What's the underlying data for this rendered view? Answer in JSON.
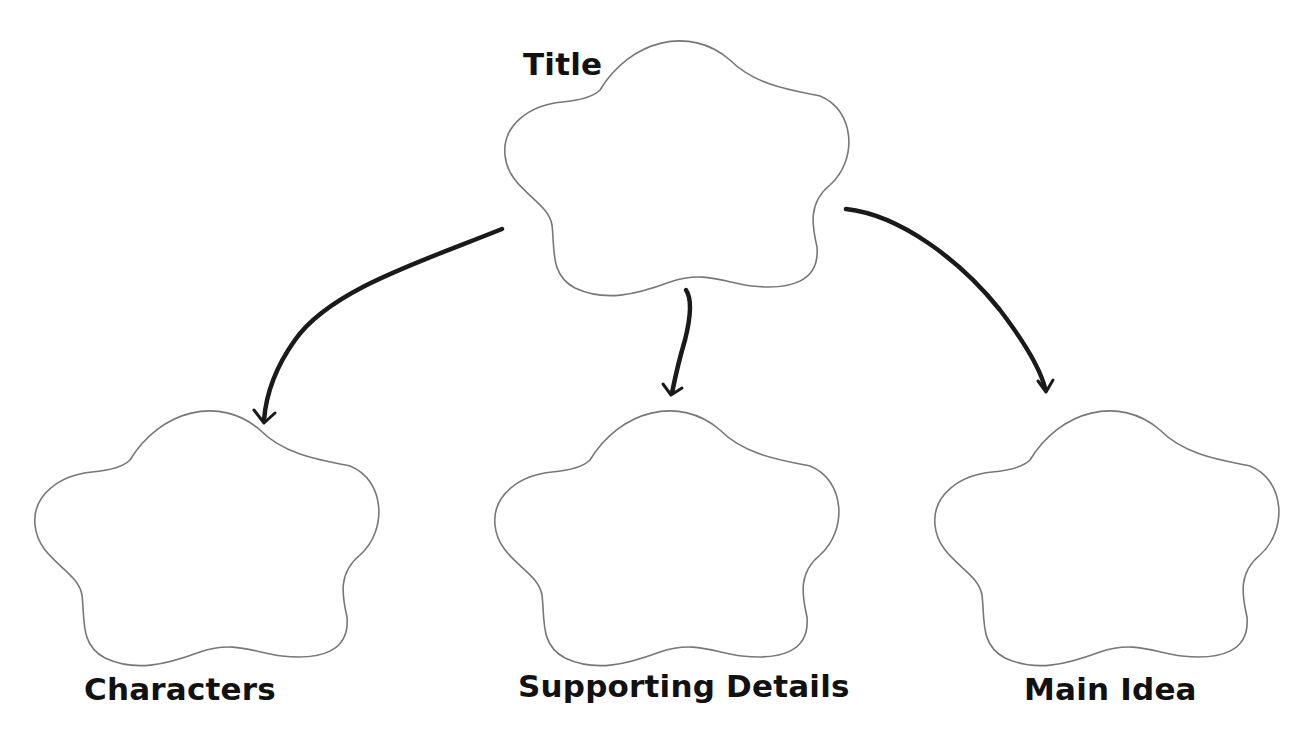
{
  "diagram": {
    "type": "graphic-organizer",
    "colors": {
      "outline": "#777777",
      "arrow": "#1a1a1a",
      "text": "#111111",
      "background": "#ffffff"
    },
    "nodes": [
      {
        "id": "title",
        "label": "Title"
      },
      {
        "id": "characters",
        "label": "Characters"
      },
      {
        "id": "supporting",
        "label": "Supporting Details"
      },
      {
        "id": "main",
        "label": "Main Idea"
      }
    ],
    "edges": [
      {
        "from": "title",
        "to": "characters"
      },
      {
        "from": "title",
        "to": "supporting"
      },
      {
        "from": "title",
        "to": "main"
      }
    ]
  }
}
